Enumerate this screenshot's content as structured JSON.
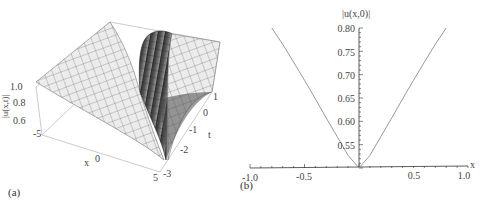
{
  "chart_data": [
    {
      "panel": "(a)",
      "type": "surface3d",
      "title": "",
      "zlabel": "|u(x,t)|",
      "xlabel": "x",
      "ylabel": "t",
      "x_ticks": [
        "-5",
        "0",
        "5"
      ],
      "t_ticks": [
        "1",
        "0",
        "-1",
        "-2",
        "-3"
      ],
      "z_ticks": [
        "1.0",
        "0.8",
        "0.6"
      ],
      "x_range": [
        -5,
        5
      ],
      "t_range": [
        -3,
        1
      ],
      "z_range": [
        0.5,
        1.0
      ],
      "description": "Surface near 1.0 background with a dark-shaded trough along a diagonal, dipping toward ~0.5 at t≈-3, x≈5 (rogue/dark-soliton shaped dip)",
      "colors": {
        "surface_light": "#e6e6e6",
        "surface_dark": "#3a3a3a",
        "mesh": "#555555",
        "box": "#aaaaaa"
      }
    },
    {
      "panel": "(b)",
      "type": "line",
      "title": "",
      "xlabel": "x",
      "ylabel": "|u(x,0)|",
      "x_ticks": [
        "-1.0",
        "-0.5",
        "0.5",
        "1.0"
      ],
      "y_ticks": [
        "0.80",
        "0.75",
        "0.70",
        "0.65",
        "0.60",
        "0.55"
      ],
      "xlim": [
        -1.0,
        1.0
      ],
      "ylim": [
        0.5,
        0.8
      ],
      "grid": false,
      "series": [
        {
          "name": "|u(x,0)|",
          "color": "#999999",
          "x": [
            -0.8,
            -0.7,
            -0.6,
            -0.5,
            -0.4,
            -0.3,
            -0.2,
            -0.1,
            0.0,
            0.1,
            0.2,
            0.3,
            0.4,
            0.5,
            0.6,
            0.7,
            0.8
          ],
          "y": [
            0.8,
            0.765,
            0.727,
            0.688,
            0.648,
            0.607,
            0.567,
            0.527,
            0.5,
            0.527,
            0.567,
            0.607,
            0.648,
            0.688,
            0.727,
            0.765,
            0.8
          ]
        }
      ]
    }
  ],
  "labels": {
    "panel_a": "(a)",
    "panel_b": "(b)"
  }
}
